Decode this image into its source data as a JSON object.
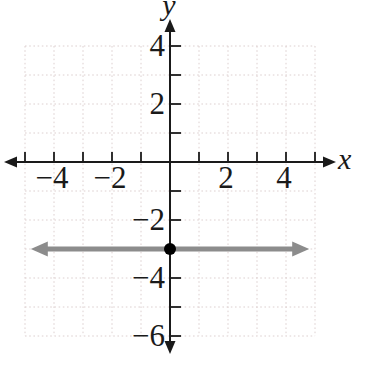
{
  "figure": {
    "background": "#ffffff",
    "colors": {
      "axis": "#1a1a1a",
      "grid": "#ddd0d0",
      "line": "#8c8c8c",
      "point": "#000000",
      "label": "#1a1a1a"
    },
    "x_axis_label": "x",
    "y_axis_label": "y"
  },
  "chart_data": {
    "type": "line",
    "xlabel": "x",
    "ylabel": "y",
    "xlim": [
      -5,
      5
    ],
    "ylim": [
      -6,
      4
    ],
    "grid": true,
    "grid_step": 1,
    "tick_step": 1,
    "x_tick_labels": [
      {
        "value": -4,
        "text": "−4"
      },
      {
        "value": -2,
        "text": "−2"
      },
      {
        "value": 2,
        "text": "2"
      },
      {
        "value": 4,
        "text": "4"
      }
    ],
    "y_tick_labels": [
      {
        "value": 4,
        "text": "4"
      },
      {
        "value": 2,
        "text": "2"
      },
      {
        "value": -2,
        "text": "−2"
      },
      {
        "value": -4,
        "text": "−4"
      },
      {
        "value": -6,
        "text": "−6"
      }
    ],
    "series": [
      {
        "name": "horizontal-line",
        "equation": "y = −3",
        "x": [
          -4.8,
          4.8
        ],
        "y": [
          -3,
          -3
        ],
        "color": "#8c8c8c",
        "width": 5,
        "arrows": "both"
      }
    ],
    "points": [
      {
        "x": 0,
        "y": -3,
        "color": "#000000",
        "radius": 6
      }
    ]
  }
}
